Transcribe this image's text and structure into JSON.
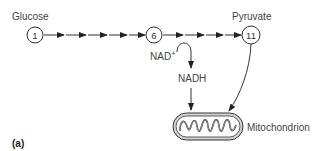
{
  "diagram": {
    "panel_label": "(a)",
    "nodes": [
      {
        "id": "1",
        "label": "1",
        "name": "Glucose"
      },
      {
        "id": "6",
        "label": "6",
        "name": ""
      },
      {
        "id": "11",
        "label": "11",
        "name": "Pyruvate"
      }
    ],
    "labels": {
      "glucose": "Glucose",
      "pyruvate": "Pyruvate",
      "nad_plus": "NAD",
      "nad_plus_sup": "+",
      "nadh": "NADH",
      "mitochondrion": "Mitochondrion"
    },
    "colors": {
      "line": "#333333",
      "text": "#444444"
    }
  }
}
